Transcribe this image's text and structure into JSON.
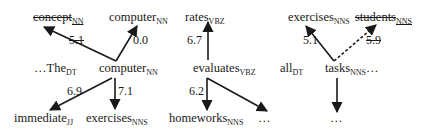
{
  "diagram": {
    "type": "dependency-parse-fragments",
    "panels": [
      {
        "id": "panel-computer",
        "tokens": {
          "concept": {
            "word": "concept",
            "tag": "NN",
            "struck": true
          },
          "computer_head": {
            "word": "computer",
            "tag": "NN"
          },
          "the": {
            "word": "…The",
            "tag": "DT"
          },
          "computer": {
            "word": "computer",
            "tag": "NN"
          },
          "immediate": {
            "word": "immediate",
            "tag": "JJ"
          },
          "exercises": {
            "word": "exercises",
            "tag": "NNS"
          }
        },
        "edges": [
          {
            "from": "computer",
            "to": "concept",
            "weight": "5.1",
            "dashed": false,
            "weight_struck": true
          },
          {
            "from": "computer",
            "to": "computer_head",
            "weight": "0.0",
            "dashed": false
          },
          {
            "from": "computer",
            "to": "immediate",
            "weight": "6.9"
          },
          {
            "from": "computer",
            "to": "exercises",
            "weight": "7.1"
          }
        ]
      },
      {
        "id": "panel-evaluates",
        "tokens": {
          "rates": {
            "word": "rates",
            "tag": "VBZ"
          },
          "evaluates": {
            "word": "evaluates",
            "tag": "VBZ"
          },
          "homeworks": {
            "word": "homeworks",
            "tag": "NNS"
          },
          "ellipsis": {
            "word": "…",
            "tag": ""
          }
        },
        "edges": [
          {
            "from": "evaluates",
            "to": "rates",
            "weight": "6.7"
          },
          {
            "from": "evaluates",
            "to": "homeworks",
            "weight": "6.2"
          },
          {
            "from": "evaluates",
            "to": "ellipsis",
            "weight": ""
          }
        ]
      },
      {
        "id": "panel-tasks",
        "tokens": {
          "exercises": {
            "word": "exercises",
            "tag": "NNS"
          },
          "students": {
            "word": "students",
            "tag": "NNS",
            "struck": true
          },
          "all": {
            "word": "all",
            "tag": "DT"
          },
          "tasks": {
            "word": "tasks",
            "tag": "NNS",
            "suffix": "…"
          },
          "ellipsis": {
            "word": "…",
            "tag": ""
          }
        },
        "edges": [
          {
            "from": "tasks",
            "to": "exercises",
            "weight": "5.1"
          },
          {
            "from": "tasks",
            "to": "students",
            "weight": "5.9",
            "dashed": true,
            "weight_struck": true
          },
          {
            "from": "tasks",
            "to": "ellipsis",
            "weight": ""
          }
        ]
      }
    ],
    "colors": {
      "ink": "#1a1a1a",
      "background": "#ffffff"
    }
  }
}
